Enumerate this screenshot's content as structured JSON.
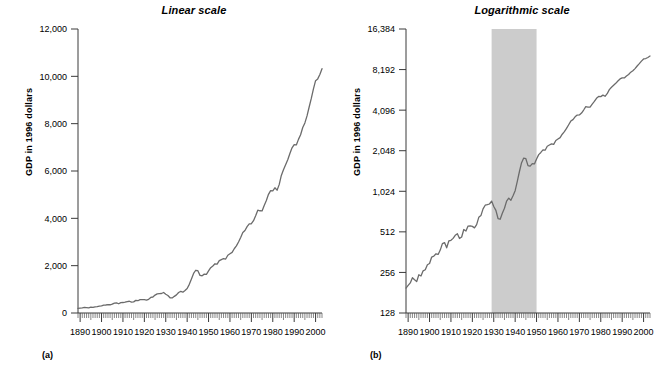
{
  "figure": {
    "panels": [
      {
        "id": "linear",
        "title": "Linear scale",
        "caption": "(a)",
        "ylabel": "GDP in 1996 dollars"
      },
      {
        "id": "logarithmic",
        "title": "Logarithmic scale",
        "caption": "(b)",
        "ylabel": "GDP in 1996 dollars"
      }
    ]
  },
  "chart_data": [
    {
      "type": "line",
      "title": "Linear scale",
      "panel": "(a)",
      "xlabel": "",
      "ylabel": "GDP in 1996 dollars",
      "yscale": "linear",
      "ylim": [
        0,
        12000
      ],
      "yticks": [
        0,
        2000,
        4000,
        6000,
        8000,
        10000,
        12000
      ],
      "ytick_labels": [
        "0",
        "2,000",
        "4,000",
        "6,000",
        "8,000",
        "10,000",
        "12,000"
      ],
      "xlim": [
        1889,
        2003
      ],
      "xticks": [
        1890,
        1900,
        1910,
        1920,
        1930,
        1940,
        1950,
        1960,
        1970,
        1980,
        1990,
        2000
      ],
      "xtick_labels": [
        "1890",
        "1900",
        "1910",
        "1920",
        "1930",
        "1940",
        "1950",
        "1960",
        "1970",
        "1980",
        "1990",
        "2000"
      ],
      "minor_tick_interval": 1,
      "grid": false,
      "legend": null,
      "line_color": "#6b6b6b",
      "series": [
        {
          "name": "Real GDP (billions of 1996 dollars)",
          "x": [
            1889,
            1890,
            1891,
            1892,
            1893,
            1894,
            1895,
            1896,
            1897,
            1898,
            1899,
            1900,
            1901,
            1902,
            1903,
            1904,
            1905,
            1906,
            1907,
            1908,
            1909,
            1910,
            1911,
            1912,
            1913,
            1914,
            1915,
            1916,
            1917,
            1918,
            1919,
            1920,
            1921,
            1922,
            1923,
            1924,
            1925,
            1926,
            1927,
            1928,
            1929,
            1930,
            1931,
            1932,
            1933,
            1934,
            1935,
            1936,
            1937,
            1938,
            1939,
            1940,
            1941,
            1942,
            1943,
            1944,
            1945,
            1946,
            1947,
            1948,
            1949,
            1950,
            1951,
            1952,
            1953,
            1954,
            1955,
            1956,
            1957,
            1958,
            1959,
            1960,
            1961,
            1962,
            1963,
            1964,
            1965,
            1966,
            1967,
            1968,
            1969,
            1970,
            1971,
            1972,
            1973,
            1974,
            1975,
            1976,
            1977,
            1978,
            1979,
            1980,
            1981,
            1982,
            1983,
            1984,
            1985,
            1986,
            1987,
            1988,
            1989,
            1990,
            1991,
            1992,
            1993,
            1994,
            1995,
            1996,
            1997,
            1998,
            1999,
            2000,
            2001,
            2002,
            2003
          ],
          "values": [
            196,
            205,
            214,
            234,
            226,
            219,
            246,
            241,
            263,
            268,
            292,
            298,
            333,
            338,
            352,
            348,
            375,
            419,
            426,
            390,
            438,
            443,
            458,
            483,
            496,
            457,
            469,
            533,
            519,
            565,
            568,
            562,
            548,
            580,
            656,
            676,
            758,
            807,
            815,
            824,
            866,
            790,
            739,
            643,
            635,
            704,
            766,
            866,
            911,
            879,
            950,
            1034,
            1211,
            1436,
            1670,
            1806,
            1786,
            1589,
            1574,
            1643,
            1634,
            1777,
            1915,
            1988,
            2080,
            2066,
            2212,
            2256,
            2301,
            2281,
            2441,
            2502,
            2560,
            2715,
            2834,
            2999,
            3192,
            3399,
            3485,
            3652,
            3766,
            3772,
            3899,
            4105,
            4342,
            4320,
            4311,
            4541,
            4751,
            5015,
            5173,
            5162,
            5292,
            5189,
            5424,
            5814,
            6054,
            6264,
            6475,
            6743,
            6981,
            7113,
            7101,
            7337,
            7533,
            7836,
            8032,
            8329,
            8704,
            9067,
            9470,
            9817,
            9891,
            10075,
            10322
          ]
        }
      ]
    },
    {
      "type": "line",
      "title": "Logarithmic scale",
      "panel": "(b)",
      "xlabel": "",
      "ylabel": "GDP in 1996 dollars",
      "yscale": "log2",
      "ylim": [
        128,
        16384
      ],
      "yticks": [
        128,
        256,
        512,
        1024,
        2048,
        4096,
        8192,
        16384
      ],
      "ytick_labels": [
        "128",
        "256",
        "512",
        "1,024",
        "2,048",
        "4,096",
        "8,192",
        "16,384"
      ],
      "xlim": [
        1889,
        2003
      ],
      "xticks": [
        1890,
        1900,
        1910,
        1920,
        1930,
        1940,
        1950,
        1960,
        1970,
        1980,
        1990,
        2000
      ],
      "xtick_labels": [
        "1890",
        "1900",
        "1910",
        "1920",
        "1930",
        "1940",
        "1950",
        "1960",
        "1970",
        "1980",
        "1990",
        "2000"
      ],
      "minor_tick_interval": 1,
      "grid": false,
      "legend": null,
      "line_color": "#6b6b6b",
      "annotations": [
        {
          "type": "shaded-band",
          "name": "depression-war-band",
          "x_start": 1929,
          "x_end": 1950,
          "color": "#cccccc"
        }
      ],
      "series": [
        {
          "name": "Real GDP (billions of 1996 dollars)",
          "x": [
            1889,
            1890,
            1891,
            1892,
            1893,
            1894,
            1895,
            1896,
            1897,
            1898,
            1899,
            1900,
            1901,
            1902,
            1903,
            1904,
            1905,
            1906,
            1907,
            1908,
            1909,
            1910,
            1911,
            1912,
            1913,
            1914,
            1915,
            1916,
            1917,
            1918,
            1919,
            1920,
            1921,
            1922,
            1923,
            1924,
            1925,
            1926,
            1927,
            1928,
            1929,
            1930,
            1931,
            1932,
            1933,
            1934,
            1935,
            1936,
            1937,
            1938,
            1939,
            1940,
            1941,
            1942,
            1943,
            1944,
            1945,
            1946,
            1947,
            1948,
            1949,
            1950,
            1951,
            1952,
            1953,
            1954,
            1955,
            1956,
            1957,
            1958,
            1959,
            1960,
            1961,
            1962,
            1963,
            1964,
            1965,
            1966,
            1967,
            1968,
            1969,
            1970,
            1971,
            1972,
            1973,
            1974,
            1975,
            1976,
            1977,
            1978,
            1979,
            1980,
            1981,
            1982,
            1983,
            1984,
            1985,
            1986,
            1987,
            1988,
            1989,
            1990,
            1991,
            1992,
            1993,
            1994,
            1995,
            1996,
            1997,
            1998,
            1999,
            2000,
            2001,
            2002,
            2003
          ],
          "values": [
            196,
            205,
            214,
            234,
            226,
            219,
            246,
            241,
            263,
            268,
            292,
            298,
            333,
            338,
            352,
            348,
            375,
            419,
            426,
            390,
            438,
            443,
            458,
            483,
            496,
            457,
            469,
            533,
            519,
            565,
            568,
            562,
            548,
            580,
            656,
            676,
            758,
            807,
            815,
            824,
            866,
            790,
            739,
            643,
            635,
            704,
            766,
            866,
            911,
            879,
            950,
            1034,
            1211,
            1436,
            1670,
            1806,
            1786,
            1589,
            1574,
            1643,
            1634,
            1777,
            1915,
            1988,
            2080,
            2066,
            2212,
            2256,
            2301,
            2281,
            2441,
            2502,
            2560,
            2715,
            2834,
            2999,
            3192,
            3399,
            3485,
            3652,
            3766,
            3772,
            3899,
            4105,
            4342,
            4320,
            4311,
            4541,
            4751,
            5015,
            5173,
            5162,
            5292,
            5189,
            5424,
            5814,
            6054,
            6264,
            6475,
            6743,
            6981,
            7113,
            7101,
            7337,
            7533,
            7836,
            8032,
            8329,
            8704,
            9067,
            9470,
            9817,
            9891,
            10075,
            10322
          ]
        }
      ]
    }
  ]
}
